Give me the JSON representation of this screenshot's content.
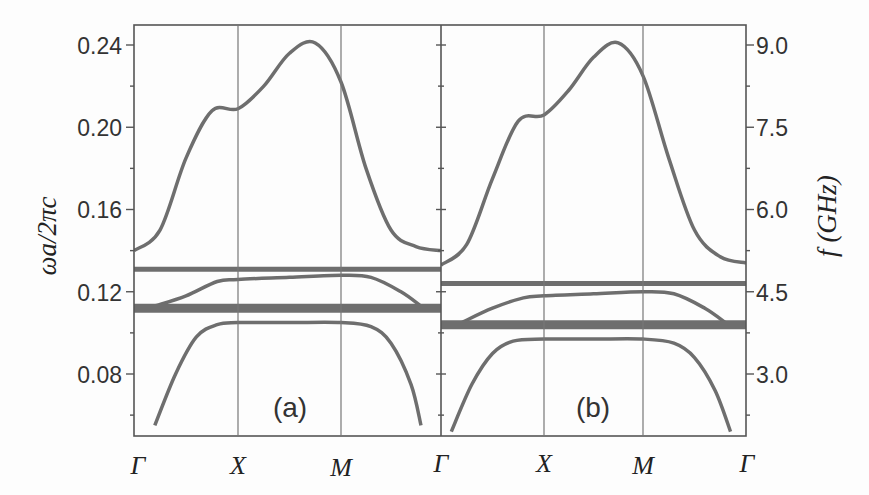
{
  "chart_data": {
    "type": "line",
    "title": "",
    "xlabel": "",
    "ylabel": "ωa/2πc",
    "ylabel_right": "f (GHz)",
    "ylim": [
      0.05,
      0.25
    ],
    "ylim_right": [
      1.875,
      9.375
    ],
    "grid": false,
    "left_ticks": [
      "0.08",
      "0.12",
      "0.16",
      "0.20",
      "0.24"
    ],
    "left_tick_values": [
      0.08,
      0.12,
      0.16,
      0.2,
      0.24
    ],
    "right_ticks": [
      "3.0",
      "4.5",
      "6.0",
      "7.5",
      "9.0"
    ],
    "right_tick_values": [
      3.0,
      4.5,
      6.0,
      7.5,
      9.0
    ],
    "k_labels": [
      "Γ",
      "X",
      "M",
      "Γ",
      "X",
      "M",
      "Γ"
    ],
    "panels": [
      {
        "label": "(a)",
        "k_points": [
          "Γ",
          "X",
          "M",
          "Γ"
        ],
        "series": [
          {
            "name": "upper band",
            "x": [
              0,
              0.25,
              0.5,
              0.75,
              1.0,
              1.25,
              1.5,
              1.75,
              2.0,
              2.25,
              2.5,
              2.75,
              3.0
            ],
            "values": [
              0.14,
              0.15,
              0.185,
              0.208,
              0.209,
              0.22,
              0.236,
              0.241,
              0.222,
              0.18,
              0.15,
              0.142,
              0.14
            ]
          },
          {
            "name": "flat band 1",
            "x": [
              0,
              3.0
            ],
            "values": [
              0.131,
              0.131
            ]
          },
          {
            "name": "middle band",
            "x": [
              0.2,
              0.5,
              0.8,
              1.0,
              1.5,
              2.0,
              2.3,
              2.6,
              2.8
            ],
            "values": [
              0.113,
              0.118,
              0.125,
              0.126,
              0.127,
              0.128,
              0.127,
              0.12,
              0.113
            ]
          },
          {
            "name": "flat band 2 (thick)",
            "x": [
              0,
              3.0
            ],
            "values": [
              0.112,
              0.112
            ]
          },
          {
            "name": "lower band",
            "x": [
              0.2,
              0.4,
              0.6,
              0.8,
              1.0,
              1.5,
              2.0,
              2.3,
              2.5,
              2.7,
              2.8
            ],
            "values": [
              0.055,
              0.08,
              0.098,
              0.104,
              0.105,
              0.105,
              0.105,
              0.103,
              0.095,
              0.075,
              0.055
            ]
          }
        ]
      },
      {
        "label": "(b)",
        "k_points": [
          "Γ",
          "X",
          "M",
          "Γ"
        ],
        "series": [
          {
            "name": "upper band",
            "x": [
              0,
              0.25,
              0.5,
              0.75,
              1.0,
              1.25,
              1.5,
              1.75,
              2.0,
              2.25,
              2.5,
              2.75,
              3.0
            ],
            "values": [
              0.133,
              0.143,
              0.175,
              0.203,
              0.206,
              0.218,
              0.234,
              0.241,
              0.225,
              0.185,
              0.15,
              0.137,
              0.134
            ]
          },
          {
            "name": "flat band 1",
            "x": [
              0,
              3.0
            ],
            "values": [
              0.124,
              0.124
            ]
          },
          {
            "name": "middle band",
            "x": [
              0.2,
              0.5,
              0.8,
              1.0,
              1.5,
              2.0,
              2.3,
              2.6,
              2.8
            ],
            "values": [
              0.105,
              0.112,
              0.117,
              0.118,
              0.119,
              0.12,
              0.119,
              0.112,
              0.105
            ]
          },
          {
            "name": "flat band 2 (thick)",
            "x": [
              0,
              3.0
            ],
            "values": [
              0.104,
              0.104
            ]
          },
          {
            "name": "lower band",
            "x": [
              0.1,
              0.3,
              0.5,
              0.7,
              1.0,
              1.5,
              2.0,
              2.3,
              2.5,
              2.7,
              2.85
            ],
            "values": [
              0.052,
              0.075,
              0.09,
              0.096,
              0.097,
              0.097,
              0.097,
              0.095,
              0.088,
              0.072,
              0.052
            ]
          }
        ]
      }
    ]
  },
  "colors": {
    "band": "#6e6e6e",
    "axis": "#555555",
    "text": "#333333",
    "background": "#fdfdfd"
  }
}
